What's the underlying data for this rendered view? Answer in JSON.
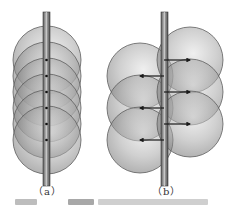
{
  "figure": {
    "panels": [
      {
        "id": "a",
        "label": "（a）",
        "rod": {
          "x": 43,
          "width": 7,
          "top": 12,
          "bottom": 186
        },
        "spheres": [
          {
            "cx": 47,
            "cy": 60,
            "r": 34
          },
          {
            "cx": 47,
            "cy": 76,
            "r": 34
          },
          {
            "cx": 47,
            "cy": 92,
            "r": 34
          },
          {
            "cx": 47,
            "cy": 108,
            "r": 34
          },
          {
            "cx": 47,
            "cy": 124,
            "r": 34
          },
          {
            "cx": 47,
            "cy": 140,
            "r": 34
          }
        ],
        "centers": [
          60,
          76,
          92,
          108,
          124,
          140
        ]
      },
      {
        "id": "b",
        "label": "（b）",
        "rod": {
          "x": 161,
          "width": 7,
          "top": 12,
          "bottom": 186
        },
        "spheres": [
          {
            "cx": 140,
            "cy": 76,
            "r": 33
          },
          {
            "cx": 140,
            "cy": 108,
            "r": 33
          },
          {
            "cx": 140,
            "cy": 140,
            "r": 33
          },
          {
            "cx": 190,
            "cy": 60,
            "r": 33
          },
          {
            "cx": 190,
            "cy": 92,
            "r": 33
          },
          {
            "cx": 190,
            "cy": 124,
            "r": 33
          }
        ],
        "arrows": [
          {
            "x1": 164,
            "y1": 60,
            "x2": 190,
            "y2": 60
          },
          {
            "x1": 164,
            "y1": 76,
            "x2": 140,
            "y2": 76
          },
          {
            "x1": 164,
            "y1": 92,
            "x2": 190,
            "y2": 92
          },
          {
            "x1": 164,
            "y1": 108,
            "x2": 140,
            "y2": 108
          },
          {
            "x1": 164,
            "y1": 124,
            "x2": 190,
            "y2": 124
          },
          {
            "x1": 164,
            "y1": 140,
            "x2": 140,
            "y2": 140
          }
        ]
      }
    ],
    "colors": {
      "sphere_light": "#d8d8d8",
      "sphere_dark": "#6e6e6e",
      "rod": "#8a8a8a",
      "rod_edge": "#3a3a3a",
      "arrow": "#1a1a1a"
    }
  }
}
